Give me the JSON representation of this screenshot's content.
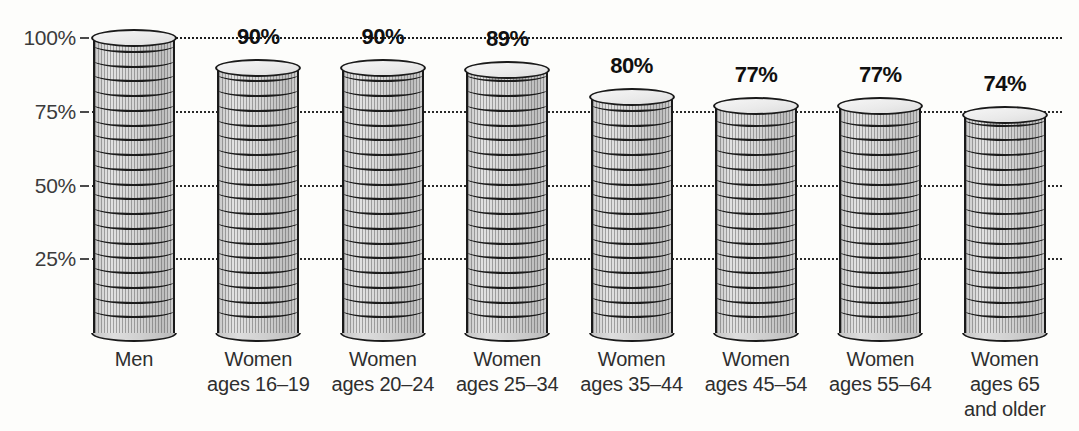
{
  "chart_data": {
    "type": "bar",
    "title": "",
    "subtitle": "",
    "xlabel": "",
    "ylabel": "",
    "ylim": [
      0,
      100
    ],
    "grid": true,
    "legend": "none",
    "axis_tick_labels": [
      "100%",
      "75%",
      "50%",
      "25%"
    ],
    "axis_tick_values": [
      100,
      75,
      50,
      25
    ],
    "categories": [
      "Men",
      "Women ages 16–19",
      "Women ages 20–24",
      "Women ages 25–34",
      "Women ages 35–44",
      "Women ages 45–54",
      "Women ages 55–64",
      "Women ages 65 and older"
    ],
    "values": [
      100,
      90,
      90,
      89,
      80,
      77,
      77,
      74
    ],
    "data_labels": [
      "",
      "90%",
      "90%",
      "89%",
      "80%",
      "77%",
      "77%",
      "74%"
    ]
  },
  "axis": {
    "ticks": [
      {
        "label": "100%",
        "value": 100
      },
      {
        "label": "75%",
        "value": 75
      },
      {
        "label": "50%",
        "value": 50
      },
      {
        "label": "25%",
        "value": 25
      }
    ]
  },
  "bars": [
    {
      "value": 100,
      "label": "",
      "cat_line1": "Men",
      "cat_line2": "",
      "cat_line3": ""
    },
    {
      "value": 90,
      "label": "90%",
      "cat_line1": "Women",
      "cat_line2": "ages 16–19",
      "cat_line3": ""
    },
    {
      "value": 90,
      "label": "90%",
      "cat_line1": "Women",
      "cat_line2": "ages 20–24",
      "cat_line3": ""
    },
    {
      "value": 89,
      "label": "89%",
      "cat_line1": "Women",
      "cat_line2": "ages 25–34",
      "cat_line3": ""
    },
    {
      "value": 80,
      "label": "80%",
      "cat_line1": "Women",
      "cat_line2": "ages 35–44",
      "cat_line3": ""
    },
    {
      "value": 77,
      "label": "77%",
      "cat_line1": "Women",
      "cat_line2": "ages 45–54",
      "cat_line3": ""
    },
    {
      "value": 77,
      "label": "77%",
      "cat_line1": "Women",
      "cat_line2": "ages 55–64",
      "cat_line3": ""
    },
    {
      "value": 74,
      "label": "74%",
      "cat_line1": "Women",
      "cat_line2": "ages 65",
      "cat_line3": "and older"
    }
  ],
  "colors": {
    "background": "#fdfdfb",
    "cylinder_fill": "#d3d3d3",
    "cylinder_top": "#eaeaea",
    "outline": "#1a1a1a",
    "gridline": "#1c1c1c",
    "label_text": "#101010",
    "axis_text": "#3b3b3b"
  }
}
